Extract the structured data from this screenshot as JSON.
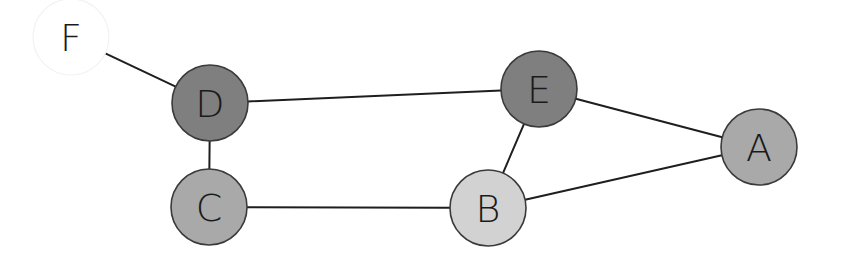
{
  "diagram": {
    "type": "undirected-graph",
    "width": 843,
    "height": 261,
    "node_radius": 38,
    "nodes": [
      {
        "id": "F",
        "label": "F",
        "x": 71,
        "y": 37,
        "fill": "#ffffff",
        "faint_border": true
      },
      {
        "id": "D",
        "label": "D",
        "x": 210,
        "y": 103,
        "fill": "#7f7f7f",
        "faint_border": false
      },
      {
        "id": "E",
        "label": "E",
        "x": 539,
        "y": 89,
        "fill": "#7f7f7f",
        "faint_border": false
      },
      {
        "id": "A",
        "label": "A",
        "x": 759,
        "y": 147,
        "fill": "#a9a9a9",
        "faint_border": false
      },
      {
        "id": "C",
        "label": "C",
        "x": 209,
        "y": 207,
        "fill": "#a9a9a9",
        "faint_border": false
      },
      {
        "id": "B",
        "label": "B",
        "x": 488,
        "y": 208,
        "fill": "#d2d2d2",
        "faint_border": false
      }
    ],
    "edges": [
      {
        "from": "F",
        "to": "D"
      },
      {
        "from": "D",
        "to": "E"
      },
      {
        "from": "D",
        "to": "C"
      },
      {
        "from": "E",
        "to": "A"
      },
      {
        "from": "E",
        "to": "B"
      },
      {
        "from": "C",
        "to": "B"
      },
      {
        "from": "B",
        "to": "A"
      }
    ]
  }
}
